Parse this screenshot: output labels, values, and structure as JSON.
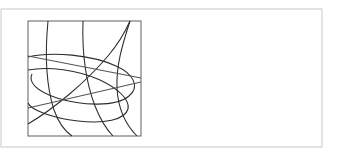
{
  "figure": {
    "title": "",
    "background_color": "#ffffff",
    "canvas": {
      "width": 337,
      "height": 160
    },
    "outer_frame": {
      "name": "outer-border",
      "x": 1,
      "y": 9,
      "width": 321,
      "height": 138,
      "stroke_color": "#c9c9c9",
      "stroke_width": 1,
      "fill": "#ffffff"
    },
    "plot_frame": {
      "name": "inner-square-frame",
      "x": 28,
      "y": 21,
      "width": 113,
      "height": 115,
      "stroke_color": "#6d6d6d",
      "stroke_width": 1.1,
      "fill": "none"
    },
    "curve_style": {
      "stroke_color": "#2b2b2b",
      "soft_stroke_color": "#545454",
      "stroke_width": 1.05
    },
    "curves": [
      {
        "name": "vertical-arc-left",
        "kind": "arc",
        "description": "near-vertical curve from top edge bending left-down to bottom edge",
        "path": "M 48 21 C 45 52, 45 82, 54 110 C 59 124, 66 132, 72 136"
      },
      {
        "name": "vertical-arc-middle",
        "kind": "arc",
        "description": "near-vertical curve from top edge bowing right then to bottom edge",
        "path": "M 83 21 C 82 50, 85 80, 95 106 C 101 121, 108 131, 113 136"
      },
      {
        "name": "parabola-right",
        "kind": "parabola",
        "description": "curve entering top-right corner, sweeping down-left then back to bottom-right edge",
        "path": "M 130 21 C 122 46, 116 66, 117 88 C 118 108, 126 125, 137 136"
      },
      {
        "name": "diagonal-curve-rising",
        "kind": "arc",
        "description": "curve rising from lower-left edge to the top-right corner",
        "path": "M 28 124 C 55 108, 86 82, 108 56 C 119 43, 126 30, 130 21"
      },
      {
        "name": "ellipse-large",
        "kind": "ellipse-arc",
        "description": "large tilted ellipse tangent to right edge, spanning most of the square",
        "path": "M 28 57 C 52 51, 92 55, 116 66 C 134 74, 140 87, 129 96 C 116 107, 82 106, 57 98 C 36 91, 28 82, 32 74"
      },
      {
        "name": "ellipse-lower",
        "kind": "ellipse-arc",
        "description": "second tilted ellipse arc, lower and flatter, crossing the left edge twice",
        "path": "M 28 70 C 48 66, 78 70, 100 80 C 119 89, 130 100, 128 109 C 125 120, 104 124, 78 121 C 52 118, 31 110, 28 103"
      },
      {
        "name": "chord-upper",
        "kind": "line",
        "description": "near-horizontal slightly sloped line across the upper-left region",
        "path": "M 28 56 L 141 78"
      },
      {
        "name": "chord-lower",
        "kind": "line",
        "description": "near-horizontal slightly sloped line across the lower-left region",
        "path": "M 28 108 L 141 82"
      }
    ]
  }
}
